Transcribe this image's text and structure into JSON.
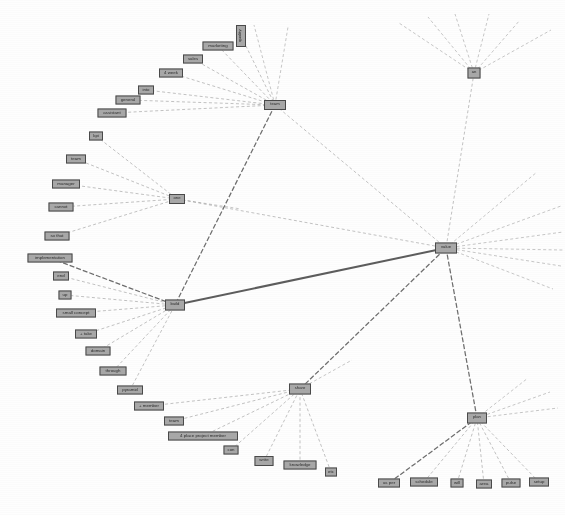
{
  "diagram": {
    "type": "node-link graph",
    "background_color": "#ffffff",
    "node_fill_color": "#a8a8a8",
    "node_border_color": "#4a4a4a",
    "edge_color": "#555555",
    "edge_style": "dashed",
    "width": 565,
    "height": 515
  },
  "nodes": [
    {
      "id": "team",
      "label": "team",
      "x": 275,
      "y": 105,
      "w": 22,
      "h": 10,
      "hub": true
    },
    {
      "id": "quality",
      "label": "quality",
      "x": 241,
      "y": 36,
      "w": 10,
      "h": 22,
      "vertical": true
    },
    {
      "id": "marketing",
      "label": "marketing",
      "x": 218,
      "y": 46,
      "w": 31,
      "h": 9,
      "hub": false
    },
    {
      "id": "sales",
      "label": "sales",
      "x": 193,
      "y": 59,
      "w": 20,
      "h": 9,
      "hub": false
    },
    {
      "id": "4-week",
      "label": "4 week",
      "x": 171,
      "y": 73,
      "w": 24,
      "h": 9,
      "hub": false
    },
    {
      "id": "into",
      "label": "into",
      "x": 146,
      "y": 90,
      "w": 16,
      "h": 9,
      "hub": false
    },
    {
      "id": "general",
      "label": "general",
      "x": 128,
      "y": 100,
      "w": 25,
      "h": 9,
      "hub": false
    },
    {
      "id": "assistant",
      "label": "assistant",
      "x": 112,
      "y": 113,
      "w": 29,
      "h": 9,
      "hub": false
    },
    {
      "id": "kpi",
      "label": "kpi",
      "x": 96,
      "y": 136,
      "w": 14,
      "h": 9,
      "hub": false
    },
    {
      "id": "one",
      "label": "one",
      "x": 177,
      "y": 199,
      "w": 16,
      "h": 10,
      "hub": true
    },
    {
      "id": "team2",
      "label": "team",
      "x": 76,
      "y": 159,
      "w": 20,
      "h": 9,
      "hub": false
    },
    {
      "id": "manager",
      "label": "manager",
      "x": 66,
      "y": 184,
      "w": 28,
      "h": 9,
      "hub": false
    },
    {
      "id": "cannot",
      "label": "cannot",
      "x": 61,
      "y": 207,
      "w": 25,
      "h": 9,
      "hub": false
    },
    {
      "id": "so-that",
      "label": "so that",
      "x": 57,
      "y": 236,
      "w": 25,
      "h": 9,
      "hub": false
    },
    {
      "id": "implementation",
      "label": "implementation",
      "x": 50,
      "y": 258,
      "w": 45,
      "h": 9,
      "hub": false
    },
    {
      "id": "build",
      "label": "build",
      "x": 175,
      "y": 305,
      "w": 20,
      "h": 11,
      "hub": true
    },
    {
      "id": "end",
      "label": "end",
      "x": 61,
      "y": 276,
      "w": 16,
      "h": 9,
      "hub": false
    },
    {
      "id": "up",
      "label": "up",
      "x": 65,
      "y": 295,
      "w": 13,
      "h": 9,
      "hub": false
    },
    {
      "id": "small-concept",
      "label": "small concept",
      "x": 76,
      "y": 313,
      "w": 40,
      "h": 9,
      "hub": false
    },
    {
      "id": "plus-take",
      "label": "+ take",
      "x": 86,
      "y": 334,
      "w": 22,
      "h": 9,
      "hub": false
    },
    {
      "id": "domain",
      "label": "domain",
      "x": 98,
      "y": 351,
      "w": 25,
      "h": 9,
      "hub": false
    },
    {
      "id": "through",
      "label": "through",
      "x": 113,
      "y": 371,
      "w": 27,
      "h": 9,
      "hub": false
    },
    {
      "id": "pyramid",
      "label": "pyramid",
      "x": 130,
      "y": 390,
      "w": 26,
      "h": 9,
      "hub": false
    },
    {
      "id": "plus-member",
      "label": "+ member",
      "x": 149,
      "y": 406,
      "w": 30,
      "h": 9,
      "hub": false
    },
    {
      "id": "share",
      "label": "share",
      "x": 300,
      "y": 389,
      "w": 22,
      "h": 11,
      "hub": true
    },
    {
      "id": "team3",
      "label": "team",
      "x": 174,
      "y": 421,
      "w": 20,
      "h": 9,
      "hub": false
    },
    {
      "id": "4-place-project",
      "label": "4 place project member",
      "x": 203,
      "y": 436,
      "w": 70,
      "h": 9,
      "hub": false
    },
    {
      "id": "con",
      "label": "con",
      "x": 231,
      "y": 450,
      "w": 15,
      "h": 9,
      "hub": false
    },
    {
      "id": "write",
      "label": "write",
      "x": 264,
      "y": 461,
      "w": 19,
      "h": 10,
      "hub": false
    },
    {
      "id": "knowledge",
      "label": "knowledge",
      "x": 300,
      "y": 465,
      "w": 33,
      "h": 9,
      "hub": false
    },
    {
      "id": "etc",
      "label": "etc",
      "x": 331,
      "y": 472,
      "w": 12,
      "h": 9,
      "hub": false
    },
    {
      "id": "value",
      "label": "value",
      "x": 446,
      "y": 248,
      "w": 22,
      "h": 11,
      "hub": true
    },
    {
      "id": "an",
      "label": "an",
      "x": 474,
      "y": 73,
      "w": 13,
      "h": 11,
      "hub": true
    },
    {
      "id": "plan",
      "label": "plan",
      "x": 477,
      "y": 418,
      "w": 20,
      "h": 11,
      "hub": true
    },
    {
      "id": "as-per",
      "label": "as per",
      "x": 389,
      "y": 483,
      "w": 22,
      "h": 9,
      "hub": false
    },
    {
      "id": "schedule",
      "label": "schedule",
      "x": 424,
      "y": 482,
      "w": 28,
      "h": 9,
      "hub": false
    },
    {
      "id": "will",
      "label": "will",
      "x": 457,
      "y": 483,
      "w": 13,
      "h": 9,
      "hub": false
    },
    {
      "id": "area",
      "label": "area",
      "x": 484,
      "y": 484,
      "w": 16,
      "h": 9,
      "hub": false
    },
    {
      "id": "pulse",
      "label": "pulse",
      "x": 511,
      "y": 483,
      "w": 19,
      "h": 9,
      "hub": false
    },
    {
      "id": "setup",
      "label": "setup",
      "x": 539,
      "y": 482,
      "w": 20,
      "h": 9,
      "hub": false
    }
  ],
  "edges": [
    {
      "from": "quality",
      "to": "team",
      "weight": 1
    },
    {
      "from": "marketing",
      "to": "team",
      "weight": 1
    },
    {
      "from": "sales",
      "to": "team",
      "weight": 1
    },
    {
      "from": "4-week",
      "to": "team",
      "weight": 1
    },
    {
      "from": "into",
      "to": "team",
      "weight": 1
    },
    {
      "from": "general",
      "to": "team",
      "weight": 1
    },
    {
      "from": "assistant",
      "to": "team",
      "weight": 1
    },
    {
      "from": "team",
      "to": "value",
      "weight": 1
    },
    {
      "from": "team",
      "to": "build",
      "weight": 2
    },
    {
      "from": "kpi",
      "to": "one",
      "weight": 1
    },
    {
      "from": "team2",
      "to": "one",
      "weight": 1
    },
    {
      "from": "manager",
      "to": "one",
      "weight": 1
    },
    {
      "from": "cannot",
      "to": "one",
      "weight": 1
    },
    {
      "from": "so-that",
      "to": "one",
      "weight": 1
    },
    {
      "from": "one",
      "to": "value",
      "weight": 1
    },
    {
      "from": "implementation",
      "to": "build",
      "weight": 2
    },
    {
      "from": "end",
      "to": "build",
      "weight": 1
    },
    {
      "from": "up",
      "to": "build",
      "weight": 1
    },
    {
      "from": "small-concept",
      "to": "build",
      "weight": 1
    },
    {
      "from": "plus-take",
      "to": "build",
      "weight": 1
    },
    {
      "from": "domain",
      "to": "build",
      "weight": 1
    },
    {
      "from": "through",
      "to": "build",
      "weight": 1
    },
    {
      "from": "pyramid",
      "to": "build",
      "weight": 1
    },
    {
      "from": "build",
      "to": "value",
      "weight": 3
    },
    {
      "from": "plus-member",
      "to": "share",
      "weight": 1
    },
    {
      "from": "team3",
      "to": "share",
      "weight": 1
    },
    {
      "from": "4-place-project",
      "to": "share",
      "weight": 1
    },
    {
      "from": "con",
      "to": "share",
      "weight": 1
    },
    {
      "from": "write",
      "to": "share",
      "weight": 1
    },
    {
      "from": "knowledge",
      "to": "share",
      "weight": 1
    },
    {
      "from": "etc",
      "to": "share",
      "weight": 1
    },
    {
      "from": "share",
      "to": "value",
      "weight": 2
    },
    {
      "from": "an",
      "to": "value",
      "weight": 1
    },
    {
      "from": "plan",
      "to": "value",
      "weight": 2
    },
    {
      "from": "as-per",
      "to": "plan",
      "weight": 2
    },
    {
      "from": "schedule",
      "to": "plan",
      "weight": 1
    },
    {
      "from": "will",
      "to": "plan",
      "weight": 1
    },
    {
      "from": "area",
      "to": "plan",
      "weight": 1
    },
    {
      "from": "pulse",
      "to": "plan",
      "weight": 1
    },
    {
      "from": "setup",
      "to": "plan",
      "weight": 1
    }
  ],
  "stub_edges": [
    {
      "from": "an",
      "x2": 399,
      "y2": 23
    },
    {
      "from": "an",
      "x2": 428,
      "y2": 17
    },
    {
      "from": "an",
      "x2": 455,
      "y2": 14
    },
    {
      "from": "an",
      "x2": 489,
      "y2": 14
    },
    {
      "from": "an",
      "x2": 520,
      "y2": 20
    },
    {
      "from": "an",
      "x2": 551,
      "y2": 30
    },
    {
      "from": "value",
      "x2": 537,
      "y2": 172
    },
    {
      "from": "value",
      "x2": 561,
      "y2": 206
    },
    {
      "from": "value",
      "x2": 563,
      "y2": 232
    },
    {
      "from": "value",
      "x2": 563,
      "y2": 250
    },
    {
      "from": "value",
      "x2": 561,
      "y2": 266
    },
    {
      "from": "value",
      "x2": 553,
      "y2": 289
    },
    {
      "from": "plan",
      "x2": 528,
      "y2": 378
    },
    {
      "from": "plan",
      "x2": 550,
      "y2": 392
    },
    {
      "from": "plan",
      "x2": 558,
      "y2": 408
    },
    {
      "from": "team",
      "x2": 288,
      "y2": 27
    },
    {
      "from": "team",
      "x2": 254,
      "y2": 25
    },
    {
      "from": "one",
      "x2": 241,
      "y2": 209
    },
    {
      "from": "share",
      "x2": 352,
      "y2": 360
    }
  ]
}
